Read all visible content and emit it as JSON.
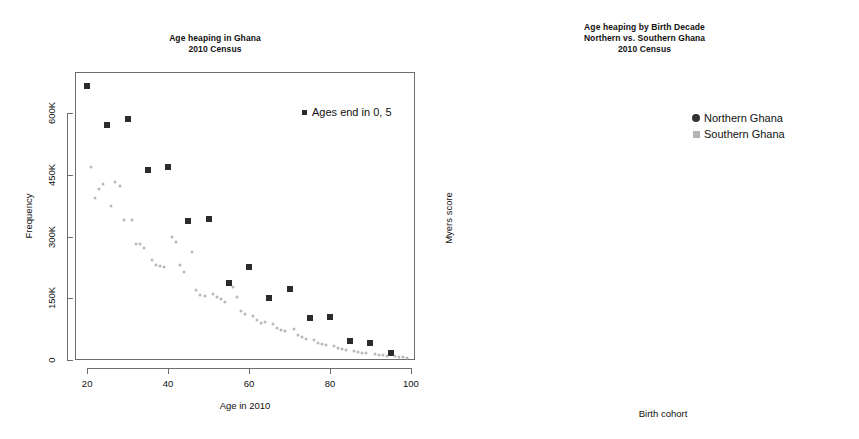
{
  "figure": {
    "background": "#ffffff",
    "panels": 2
  },
  "left_panel": {
    "title": "Age heaping in Ghana\n2010 Census",
    "xlabel": "Age in 2010",
    "ylabel": "Frequency",
    "legend_label": "Ages end in 0, 5"
  },
  "right_panel": {
    "title": "Age heaping by Birth Decade\nNorthern vs. Southern Ghana\n2010 Census",
    "xlabel": "Birth cohort",
    "ylabel": "Myers score",
    "legend": [
      {
        "label": "Northern Ghana",
        "marker": "circle",
        "color": "#333333"
      },
      {
        "label": "Southern Ghana",
        "marker": "square",
        "color": "#b4b4b4"
      }
    ],
    "annotations": [
      {
        "text": "SSA (mean, 1980–2010)",
        "value": 13.2
      },
      {
        "text": "W. Europe (mean, 1960–2010)",
        "value": 1.2
      }
    ]
  },
  "chart_data": [
    {
      "id": "age-heaping-scatter",
      "type": "scatter",
      "title": "Age heaping in Ghana\n2010 Census",
      "xlabel": "Age in 2010",
      "ylabel": "Frequency",
      "xlim": [
        17,
        101
      ],
      "ylim": [
        0,
        700000
      ],
      "xticks": [
        20,
        40,
        60,
        80,
        100
      ],
      "yticks": [
        0,
        150000,
        300000,
        450000,
        600000
      ],
      "ytick_labels": [
        "0",
        "150K",
        "300K",
        "450K",
        "600K"
      ],
      "grid": false,
      "legend_position": "top-right",
      "series": [
        {
          "name": "Ages end in 0, 5",
          "marker": "square",
          "color": "#2b2b2b",
          "points": [
            [
              20,
              665000
            ],
            [
              25,
              570000
            ],
            [
              30,
              585000
            ],
            [
              35,
              462000
            ],
            [
              40,
              468000
            ],
            [
              45,
              338000
            ],
            [
              50,
              342000
            ],
            [
              55,
              188000
            ],
            [
              60,
              225000
            ],
            [
              65,
              150000
            ],
            [
              70,
              172000
            ],
            [
              75,
              103000
            ],
            [
              80,
              105000
            ],
            [
              85,
              45000
            ],
            [
              90,
              42000
            ],
            [
              95,
              18000
            ]
          ]
        },
        {
          "name": "Other ages",
          "marker": "circle",
          "color": "#b8b8b8",
          "points": [
            [
              21,
              468000
            ],
            [
              22,
              393000
            ],
            [
              23,
              415000
            ],
            [
              24,
              428000
            ],
            [
              26,
              375000
            ],
            [
              27,
              432000
            ],
            [
              28,
              424000
            ],
            [
              29,
              340000
            ],
            [
              31,
              340000
            ],
            [
              32,
              282000
            ],
            [
              33,
              282000
            ],
            [
              34,
              272000
            ],
            [
              36,
              243000
            ],
            [
              37,
              232000
            ],
            [
              38,
              228000
            ],
            [
              39,
              225000
            ],
            [
              41,
              300000
            ],
            [
              42,
              288000
            ],
            [
              43,
              232000
            ],
            [
              44,
              215000
            ],
            [
              46,
              263000
            ],
            [
              47,
              170000
            ],
            [
              48,
              158000
            ],
            [
              49,
              155000
            ],
            [
              51,
              160000
            ],
            [
              52,
              152000
            ],
            [
              53,
              148000
            ],
            [
              54,
              142000
            ],
            [
              56,
              178000
            ],
            [
              57,
              152000
            ],
            [
              58,
              120000
            ],
            [
              59,
              112000
            ],
            [
              61,
              108000
            ],
            [
              62,
              98000
            ],
            [
              63,
              90000
            ],
            [
              64,
              92000
            ],
            [
              66,
              88000
            ],
            [
              67,
              78000
            ],
            [
              68,
              72000
            ],
            [
              69,
              70000
            ],
            [
              71,
              75000
            ],
            [
              72,
              60000
            ],
            [
              73,
              55000
            ],
            [
              74,
              52000
            ],
            [
              76,
              48000
            ],
            [
              77,
              42000
            ],
            [
              78,
              38000
            ],
            [
              79,
              36000
            ],
            [
              81,
              34000
            ],
            [
              82,
              30000
            ],
            [
              83,
              26000
            ],
            [
              84,
              24000
            ],
            [
              86,
              22000
            ],
            [
              87,
              19000
            ],
            [
              88,
              17000
            ],
            [
              89,
              16000
            ],
            [
              91,
              15000
            ],
            [
              92,
              13000
            ],
            [
              93,
              11000
            ],
            [
              94,
              10000
            ],
            [
              96,
              9000
            ],
            [
              97,
              8000
            ],
            [
              98,
              7000
            ],
            [
              99,
              6000
            ]
          ]
        }
      ]
    },
    {
      "id": "myers-score-by-cohort",
      "type": "line",
      "title": "Age heaping by Birth Decade\nNorthern vs. Southern Ghana\n2010 Census",
      "xlabel": "Birth cohort",
      "ylabel": "Myers score",
      "categories": [
        "1911–1930",
        "1931–1950",
        "1951–1970",
        "1971–1990"
      ],
      "ylim": [
        0,
        47
      ],
      "yticks": [
        0,
        10,
        20,
        30,
        40
      ],
      "grid": false,
      "legend_position": "top-right",
      "series": [
        {
          "name": "Northern Ghana",
          "marker": "circle",
          "color": "#333333",
          "values": [
            35.8,
            36.3,
            30.9,
            21.0
          ]
        },
        {
          "name": "Southern Ghana",
          "marker": "square",
          "color": "#b4b4b4",
          "values": [
            26.5,
            21.1,
            13.4,
            8.3
          ]
        }
      ],
      "reference_lines": [
        {
          "label": "SSA (mean, 1980–2010)",
          "value": 13.2
        },
        {
          "label": "W. Europe (mean, 1960–2010)",
          "value": 1.2
        }
      ]
    }
  ]
}
